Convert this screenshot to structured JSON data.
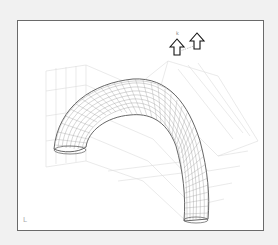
{
  "figure": {
    "viewport": {
      "background": "#ffffff",
      "border_color": "#6a6a6a",
      "page_color": "#f1f1f1"
    },
    "handles": [
      {
        "name": "up-arrow-handle-left",
        "x": 169,
        "y": 46
      },
      {
        "name": "up-arrow-handle-right",
        "x": 189,
        "y": 39
      }
    ],
    "small_label": "k",
    "axis_indicator": "L"
  }
}
